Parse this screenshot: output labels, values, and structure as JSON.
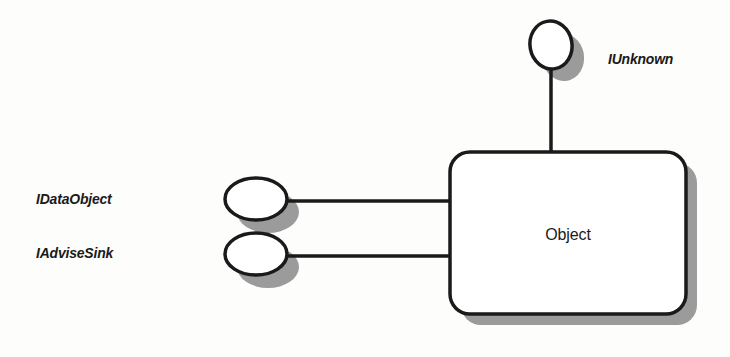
{
  "figure": {
    "kind": "com-object-interface-diagram",
    "notation": "lollipop",
    "canvas": {
      "width": 730,
      "height": 357
    },
    "colors": {
      "background": "#fdfdfb",
      "stroke": "#1a1a1a",
      "shadow": "#9a9a9a",
      "fill": "#ffffff",
      "text": "#1a1a1a"
    }
  },
  "object_box": {
    "title": "Object",
    "shape": "rounded-rectangle",
    "x": 450,
    "y": 152,
    "width": 236,
    "height": 162,
    "corner_radius": 20,
    "shadow_offset_x": 11,
    "shadow_offset_y": 11
  },
  "interfaces": [
    {
      "id": "iunknown",
      "label": "IUnknown",
      "orientation": "top",
      "lollipop": {
        "cx": 551,
        "cy": 45,
        "rx": 21,
        "ry": 24,
        "rotation": -10
      },
      "stem": {
        "x1": 551,
        "y1": 69,
        "x2": 551,
        "y2": 152
      },
      "label_position": {
        "x": 608,
        "y": 50
      }
    },
    {
      "id": "idataobject",
      "label": "IDataObject",
      "orientation": "left",
      "lollipop": {
        "cx": 256,
        "cy": 199,
        "rx": 31,
        "ry": 21,
        "rotation": 0
      },
      "stem": {
        "x1": 287,
        "y1": 201,
        "x2": 452,
        "y2": 201
      },
      "label_position": {
        "x": 36,
        "y": 190
      }
    },
    {
      "id": "iadvisesink",
      "label": "IAdviseSink",
      "orientation": "left",
      "lollipop": {
        "cx": 256,
        "cy": 254,
        "rx": 31,
        "ry": 21,
        "rotation": 0
      },
      "stem": {
        "x1": 287,
        "y1": 256,
        "x2": 452,
        "y2": 256
      },
      "label_position": {
        "x": 36,
        "y": 244
      }
    }
  ]
}
